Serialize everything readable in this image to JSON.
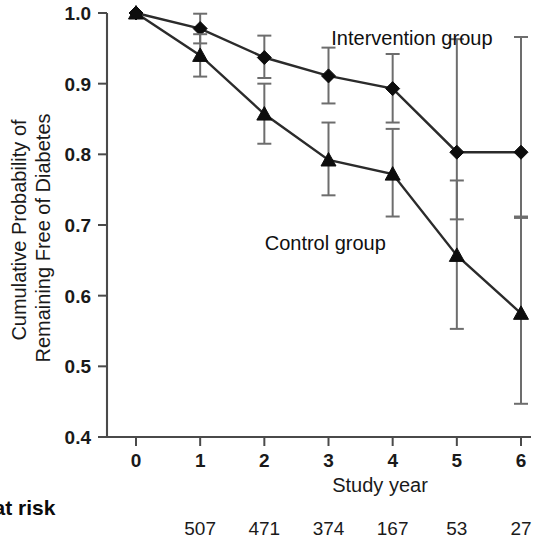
{
  "chart_data": {
    "type": "line",
    "title": "",
    "xlabel": "Study year",
    "ylabel": "Cumulative Probability of Remaining Free of Diabetes",
    "ylabel_line1": "Cumulative Probability of",
    "ylabel_line2": "Remaining Free of Diabetes",
    "x": [
      0,
      1,
      2,
      3,
      4,
      5,
      6
    ],
    "xlim": [
      0,
      6
    ],
    "ylim": [
      0.4,
      1.0
    ],
    "xticks": [
      "0",
      "1",
      "2",
      "3",
      "4",
      "5",
      "6"
    ],
    "yticks": [
      "0.4",
      "0.5",
      "0.6",
      "0.7",
      "0.8",
      "0.9",
      "1.0"
    ],
    "grid": false,
    "legend_position": "inline-annotations",
    "series": [
      {
        "name": "Intervention group",
        "marker": "diamond",
        "values": [
          1.0,
          0.978,
          0.937,
          0.911,
          0.893,
          0.803,
          0.803
        ],
        "err_low": [
          1.0,
          0.957,
          0.908,
          0.872,
          0.845,
          0.708,
          0.712
        ],
        "err_high": [
          1.0,
          0.999,
          0.968,
          0.951,
          0.942,
          0.963,
          0.966
        ]
      },
      {
        "name": "Control group",
        "marker": "triangle",
        "values": [
          1.0,
          0.94,
          0.857,
          0.792,
          0.772,
          0.657,
          0.575
        ],
        "err_low": [
          1.0,
          0.91,
          0.815,
          0.742,
          0.712,
          0.553,
          0.447
        ],
        "err_high": [
          1.0,
          0.97,
          0.9,
          0.845,
          0.836,
          0.763,
          0.71
        ]
      }
    ],
    "annotations": [
      {
        "text": "Intervention group",
        "x": 4.3,
        "y": 0.955
      },
      {
        "text": "Control group",
        "x": 2.95,
        "y": 0.665
      }
    ]
  },
  "risk_table": {
    "label": "s at risk",
    "counts": [
      "507",
      "471",
      "374",
      "167",
      "53",
      "27"
    ],
    "count_x": [
      1,
      2,
      3,
      4,
      5,
      6
    ]
  }
}
